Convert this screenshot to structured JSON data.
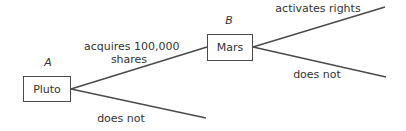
{
  "diagram": {
    "type": "decision-tree",
    "nodes": [
      {
        "id": "A",
        "player_label": "A",
        "name": "Pluto"
      },
      {
        "id": "B",
        "player_label": "B",
        "name": "Mars"
      }
    ],
    "edges": [
      {
        "from": "Pluto",
        "to": "Mars",
        "label_line1": "acquires 100,000",
        "label_line2": "shares"
      },
      {
        "from": "Pluto",
        "to": "end",
        "label": "does not"
      },
      {
        "from": "Mars",
        "to": "end",
        "label": "activates rights"
      },
      {
        "from": "Mars",
        "to": "end",
        "label": "does not"
      }
    ],
    "colors": {
      "line": "#4a4a4a",
      "text": "#333333",
      "background": "#ffffff"
    }
  }
}
